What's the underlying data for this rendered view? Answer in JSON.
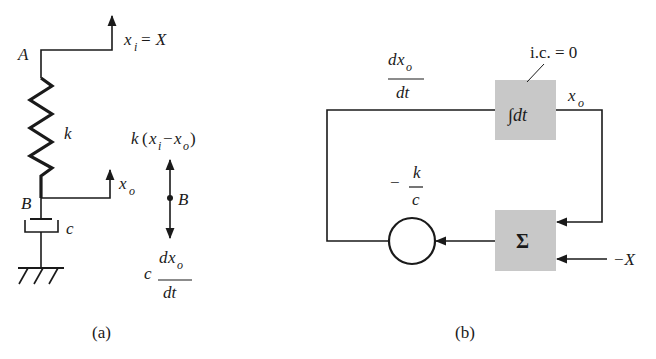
{
  "figure_a": {
    "caption": "(a)",
    "point_a_label": "A",
    "point_b_label": "B",
    "spring_label": "k",
    "damper_label": "c",
    "input_label": "x",
    "input_sub": "i",
    "input_rhs": " = X",
    "output_label": "x",
    "output_sub": "o",
    "fbd": {
      "node_label": "B",
      "spring_force": {
        "k": "k",
        "open": "(",
        "x1": "x",
        "s1": "i",
        "minus": "−",
        "x2": "x",
        "s2": "o",
        "close": ")"
      },
      "damper_force": {
        "c": "c",
        "num_d": "d",
        "num_x": "x",
        "num_sub": "o",
        "den": "dt"
      }
    }
  },
  "figure_b": {
    "caption": "(b)",
    "rate_label": {
      "num_d": "d",
      "num_x": "x",
      "num_sub": "o",
      "den": "dt"
    },
    "integrator": {
      "label": "∫dt",
      "initial_condition": "i.c. = 0"
    },
    "integrator_output": {
      "x": "x",
      "sub": "o"
    },
    "summer": {
      "label": "Σ"
    },
    "gain": {
      "minus": "−",
      "num": "k",
      "den": "c"
    },
    "external_input": "−X",
    "colors": {
      "block_fill": "#c8c8c8",
      "line": "#1a1a1a"
    }
  }
}
